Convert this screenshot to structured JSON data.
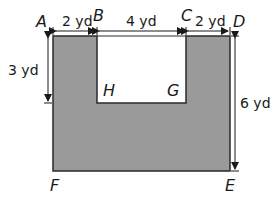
{
  "figure": {
    "shape_fill": "#9a9a9a",
    "outline_color": "#2a2a2a",
    "notch_fill": "#ffffff",
    "points": {
      "A": "A",
      "B": "B",
      "C": "C",
      "D": "D",
      "E": "E",
      "F": "F",
      "G": "G",
      "H": "H"
    },
    "dimensions": {
      "AB": "2 yd",
      "BC": "4 yd",
      "CD": "2 yd",
      "AH_vertical": "3 yd",
      "DE": "6 yd"
    }
  }
}
